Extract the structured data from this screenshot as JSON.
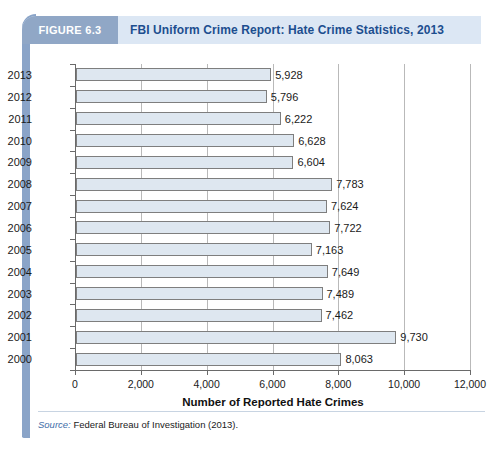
{
  "figure": {
    "badge_label": "FIGURE 6.3",
    "title": "FBI Uniform Crime Report: Hate Crime Statistics, 2013",
    "badge_color": "#90a7c6",
    "header_color": "#dce7f4",
    "title_color": "#1c4e8f",
    "rail_color": "#8aa4c8"
  },
  "source": {
    "label": "Source:",
    "text": "Federal Bureau of Investigation (2013)."
  },
  "chart_data": {
    "type": "bar",
    "orientation": "horizontal",
    "title": "FBI Uniform Crime Report: Hate Crime Statistics, 2013",
    "xlabel": "Number of Reported Hate Crimes",
    "ylabel": "",
    "xlim": [
      0,
      12000
    ],
    "xticks": [
      0,
      2000,
      4000,
      6000,
      8000,
      10000,
      12000
    ],
    "xtick_labels": [
      "0",
      "2,000",
      "4,000",
      "6,000",
      "8,000",
      "10,000",
      "12,000"
    ],
    "grid": "vertical",
    "legend": "none",
    "bar_fill": "#dee7f0",
    "bar_border": "#7e7e7e",
    "categories": [
      "2013",
      "2012",
      "2011",
      "2010",
      "2009",
      "2008",
      "2007",
      "2006",
      "2005",
      "2004",
      "2003",
      "2002",
      "2001",
      "2000"
    ],
    "values": [
      5928,
      5796,
      6222,
      6628,
      6604,
      7783,
      7624,
      7722,
      7163,
      7649,
      7489,
      7462,
      9730,
      8063
    ],
    "value_labels": [
      "5,928",
      "5,796",
      "6,222",
      "6,628",
      "6,604",
      "7,783",
      "7,624",
      "7,722",
      "7,163",
      "7,649",
      "7,489",
      "7,462",
      "9,730",
      "8,063"
    ]
  }
}
